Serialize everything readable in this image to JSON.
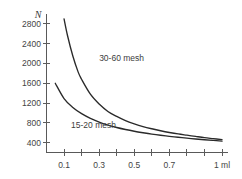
{
  "figure": {
    "background_color": "#ffffff",
    "ink_color": "#2a2a2a",
    "axis_color": "#595959"
  },
  "chart_data": {
    "type": "line",
    "title": "",
    "subtitle": "",
    "xlabel": "1 ml",
    "ylabel": "N",
    "xlim": [
      0.0,
      1.0
    ],
    "ylim": [
      200,
      3000
    ],
    "grid": false,
    "legend_position": "inline-annotation",
    "x_tick_values": [
      0.1,
      0.2,
      0.3,
      0.4,
      0.5,
      0.6,
      0.7,
      0.8,
      0.9,
      1.0
    ],
    "x_tick_labels": [
      "0.1",
      "",
      "0.3",
      "",
      "0.5",
      "",
      "0.7",
      "",
      "",
      "1 ml"
    ],
    "y_tick_values": [
      400,
      800,
      1200,
      1600,
      2000,
      2400,
      2800
    ],
    "y_tick_labels": [
      "400",
      "800",
      "1200",
      "1600",
      "2000",
      "2400",
      "2800"
    ],
    "annotations": [
      {
        "text": "30-60 mesh",
        "x": 0.3,
        "y": 2050
      },
      {
        "text": "15-20 mesh",
        "x": 0.14,
        "y": 700
      }
    ],
    "series": [
      {
        "name": "30-60 mesh",
        "x": [
          0.1,
          0.12,
          0.15,
          0.18,
          0.2,
          0.25,
          0.3,
          0.35,
          0.4,
          0.45,
          0.5,
          0.55,
          0.6,
          0.65,
          0.7,
          0.75,
          0.8,
          0.85,
          0.9,
          0.95,
          1.0
        ],
        "values": [
          2900,
          2560,
          2150,
          1830,
          1680,
          1380,
          1180,
          1030,
          930,
          845,
          780,
          725,
          680,
          640,
          605,
          575,
          550,
          525,
          500,
          480,
          460
        ]
      },
      {
        "name": "15-20 mesh",
        "x": [
          0.05,
          0.1,
          0.15,
          0.2,
          0.25,
          0.3,
          0.35,
          0.4,
          0.45,
          0.5,
          0.55,
          0.6,
          0.65,
          0.7,
          0.75,
          0.8,
          0.85,
          0.9,
          0.95,
          1.0
        ],
        "values": [
          1600,
          1290,
          1110,
          985,
          890,
          815,
          755,
          705,
          665,
          630,
          600,
          572,
          548,
          527,
          508,
          490,
          473,
          458,
          444,
          430
        ]
      }
    ]
  }
}
